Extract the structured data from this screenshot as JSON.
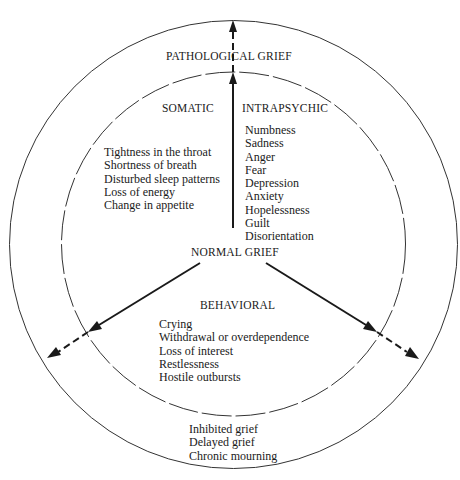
{
  "diagram": {
    "outer_ring_label": "PATHOLOGICAL GRIEF",
    "center_label": "NORMAL GRIEF",
    "categories": {
      "somatic": {
        "title": "SOMATIC",
        "items": [
          "Tightness in the throat",
          "Shortness of breath",
          "Disturbed sleep patterns",
          "Loss of energy",
          "Change in appetite"
        ]
      },
      "intrapsychic": {
        "title": "INTRAPSYCHIC",
        "items": [
          "Numbness",
          "Sadness",
          "Anger",
          "Fear",
          "Depression",
          "Anxiety",
          "Hopelessness",
          "Guilt",
          "Disorientation"
        ]
      },
      "behavioral": {
        "title": "BEHAVIORAL",
        "items": [
          "Crying",
          "Withdrawal or overdependence",
          "Loss of interest",
          "Restlessness",
          "Hostile outbursts"
        ]
      }
    },
    "pathological_types": [
      "Inhibited grief",
      "Delayed grief",
      "Chronic mourning"
    ],
    "colors": {
      "ink": "#1a1a1a",
      "background": "#ffffff"
    }
  }
}
